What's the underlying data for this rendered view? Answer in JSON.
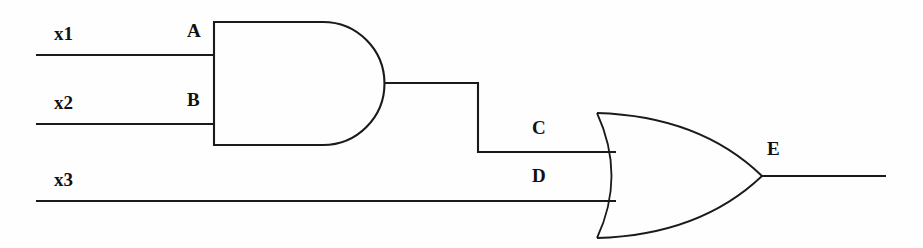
{
  "diagram": {
    "background_color": "#fffefe",
    "line_color": "#1a1a1a",
    "width": 923,
    "height": 248
  },
  "inputs": [
    {
      "id": "x1",
      "label": "x1",
      "wire_y": 55,
      "wire_x_start": 36,
      "wire_x_end": 213
    },
    {
      "id": "x2",
      "label": "x2",
      "wire_y": 124,
      "wire_x_start": 36,
      "wire_x_end": 213
    },
    {
      "id": "x3",
      "label": "x3",
      "wire_y": 201,
      "wire_x_start": 36,
      "wire_x_end": 615
    }
  ],
  "pin_labels": [
    {
      "id": "A",
      "label": "A",
      "gate": "and-gate",
      "role": "input"
    },
    {
      "id": "B",
      "label": "B",
      "gate": "and-gate",
      "role": "input"
    },
    {
      "id": "C",
      "label": "C",
      "gate": "or-gate",
      "role": "input"
    },
    {
      "id": "D",
      "label": "D",
      "gate": "or-gate",
      "role": "input"
    },
    {
      "id": "E",
      "label": "E",
      "gate": "or-gate",
      "role": "output"
    }
  ],
  "gates": [
    {
      "id": "and-gate",
      "type": "AND",
      "inputs": [
        "A",
        "B"
      ],
      "output": "C",
      "left": 213,
      "top": 22,
      "bottom": 145,
      "tip_x": 385,
      "output_y": 83
    },
    {
      "id": "or-gate",
      "type": "OR",
      "inputs": [
        "C",
        "D"
      ],
      "output": "E",
      "left": 597,
      "top": 113,
      "bottom": 238,
      "tip_x": 762,
      "output_y": 176
    }
  ],
  "output": {
    "id": "E",
    "label": "E",
    "wire_y": 176,
    "wire_x_start": 762,
    "wire_x_end": 886
  },
  "label_positions": {
    "x1": {
      "x": 54,
      "y": 24
    },
    "x2": {
      "x": 54,
      "y": 93
    },
    "x3": {
      "x": 54,
      "y": 170
    },
    "A": {
      "x": 187,
      "y": 21
    },
    "B": {
      "x": 187,
      "y": 90
    },
    "C": {
      "x": 532,
      "y": 118
    },
    "D": {
      "x": 532,
      "y": 166
    },
    "E": {
      "x": 767,
      "y": 139
    }
  }
}
